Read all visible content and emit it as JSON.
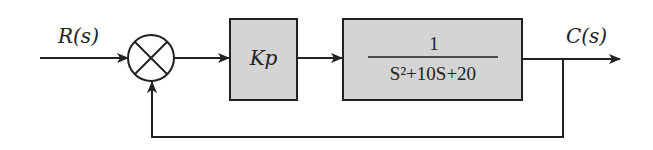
{
  "diagram": {
    "type": "closed-loop feedback block diagram",
    "input_label": "R(s)",
    "output_label": "C(s)",
    "summing_junction": "summing-junction",
    "controller_block": {
      "label": "Kp"
    },
    "plant_block": {
      "numerator": "1",
      "denominator": "S²+10S+20"
    },
    "feedback": "unity",
    "colors": {
      "block_fill": "#d4d4d4",
      "line": "#222222"
    }
  }
}
